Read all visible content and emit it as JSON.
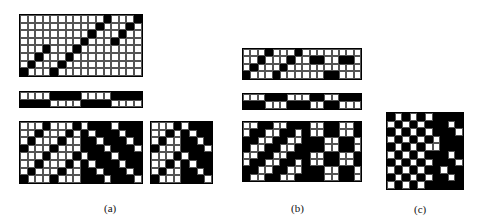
{
  "figure": {
    "panels": [
      {
        "id": "a",
        "label": "(a)"
      },
      {
        "id": "b",
        "label": "(b)"
      },
      {
        "id": "c",
        "label": "(c)"
      }
    ]
  },
  "grids": {
    "a_top": {
      "x": 19,
      "y": 14,
      "cols": 16,
      "rows": 8,
      "cell": 7.6,
      "pattern": [
        "0000000000010001",
        "0000000000100010",
        "0000000001000100",
        "0000000010001000",
        "0001000100000000",
        "0010001000000000",
        "0100010000000000",
        "1000100000000000"
      ]
    },
    "a_mid": {
      "x": 19,
      "y": 91,
      "cols": 16,
      "rows": 2,
      "cell": 7.6,
      "pattern": [
        "0000111100001111",
        "1111000011110000"
      ]
    },
    "a_bottom": {
      "x": 19,
      "y": 121,
      "cols": 16,
      "rows": 8,
      "cell": 7.6,
      "pattern": [
        "0001000101110111",
        "0010001010111011",
        "0100010011011101",
        "1000100011101110",
        "0001000101110111",
        "0010001010111011",
        "0100010011011101",
        "1000100011101110"
      ]
    },
    "a_small": {
      "x": 150,
      "y": 121,
      "cols": 8,
      "rows": 8,
      "cell": 7.6,
      "pattern": [
        "00010111",
        "00101011",
        "01001101",
        "10001110",
        "00010111",
        "00101011",
        "01001101",
        "10001110"
      ]
    },
    "b_top": {
      "x": 242,
      "y": 48,
      "cols": 16,
      "rows": 4,
      "cell": 7.4,
      "pattern": [
        "0001000100000000",
        "0010001001100110",
        "0100010000000000",
        "1000100000011000"
      ]
    },
    "b_mid": {
      "x": 242,
      "y": 93,
      "cols": 16,
      "rows": 2,
      "cell": 7.4,
      "pattern": [
        "0001110001100111",
        "1110001110011000"
      ]
    },
    "b_bottom": {
      "x": 242,
      "y": 121,
      "cols": 16,
      "rows": 8,
      "cell": 7.4,
      "pattern": [
        "0011001110011001",
        "0110011010011001",
        "1100110011100110",
        "1001100111100110",
        "0011001110011001",
        "0110011010011001",
        "1100110011100110",
        "1001100111100110"
      ]
    },
    "c": {
      "x": 386,
      "y": 112,
      "cols": 10,
      "rows": 10,
      "cell": 7.6,
      "pattern": [
        "1010101111",
        "0101011101",
        "1010101110",
        "0101010111",
        "1010100111",
        "0101011101",
        "1010101110",
        "0101011011",
        "1010101101",
        "0101011111"
      ]
    }
  },
  "labels": {
    "a": {
      "text": "(a)",
      "x": 104,
      "y": 212
    },
    "b": {
      "text": "(b)",
      "x": 291,
      "y": 212
    },
    "c": {
      "text": "(c)",
      "x": 414,
      "y": 213
    }
  }
}
